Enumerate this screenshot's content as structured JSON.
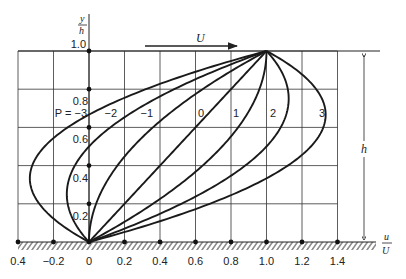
{
  "figure": {
    "y_axis_label_num": "y",
    "y_axis_label_den": "h",
    "x_axis_label_num": "u",
    "x_axis_label_den": "U",
    "plate_velocity_label": "U",
    "height_label": "h",
    "pressure_prefix": "P = "
  },
  "chart_data": {
    "type": "line",
    "xlabel": "u/U",
    "ylabel": "y/h",
    "xlim": [
      -0.4,
      1.4
    ],
    "ylim": [
      0,
      1.0
    ],
    "grid": true,
    "x_ticks": [
      "0.4",
      "−0.2",
      "0",
      "0.2",
      "0.4",
      "0.6",
      "0.8",
      "1.0",
      "1.2",
      "1.4"
    ],
    "x_tick_values": [
      -0.4,
      -0.2,
      0,
      0.2,
      0.4,
      0.6,
      0.8,
      1.0,
      1.2,
      1.4
    ],
    "y_ticks": [
      "0.2",
      "0.4",
      "0.6",
      "0.8",
      "1.0"
    ],
    "y_tick_values": [
      0.2,
      0.4,
      0.6,
      0.8,
      1.0
    ],
    "series": [
      {
        "name": "P = −3",
        "P": -3,
        "label": "−3"
      },
      {
        "name": "P = −2",
        "P": -2,
        "label": "−2"
      },
      {
        "name": "P = −1",
        "P": -1,
        "label": "−1"
      },
      {
        "name": "P = 0",
        "P": 0,
        "label": "0"
      },
      {
        "name": "P = 1",
        "P": 1,
        "label": "1"
      },
      {
        "name": "P = 2",
        "P": 2,
        "label": "2"
      },
      {
        "name": "P = 3",
        "P": 3,
        "label": "3"
      }
    ]
  }
}
